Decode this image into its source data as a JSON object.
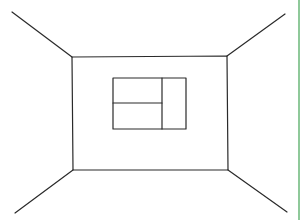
{
  "drawing": {
    "subject": "one-point perspective room sketch",
    "stroke_color": "#2a2a2a",
    "background_color": "#ffffff",
    "border_color": "#8fc99a",
    "back_wall": {
      "points": [
        [
          72,
          57
        ],
        [
          227,
          56
        ],
        [
          228,
          170
        ],
        [
          73,
          170
        ]
      ]
    },
    "perspective_lines": [
      {
        "name": "ceiling-left-edge",
        "from": [
          12,
          12
        ],
        "to": [
          72,
          57
        ]
      },
      {
        "name": "ceiling-right-edge",
        "from": [
          285,
          14
        ],
        "to": [
          227,
          56
        ]
      },
      {
        "name": "floor-left-edge",
        "from": [
          73,
          170
        ],
        "to": [
          15,
          213
        ]
      },
      {
        "name": "floor-right-edge",
        "from": [
          228,
          170
        ],
        "to": [
          287,
          212
        ]
      }
    ],
    "window": {
      "outer": {
        "x": 113,
        "y": 78,
        "w": 73,
        "h": 51
      },
      "vertical_divider_x": 162,
      "horizontal_divider_y": 103
    }
  }
}
